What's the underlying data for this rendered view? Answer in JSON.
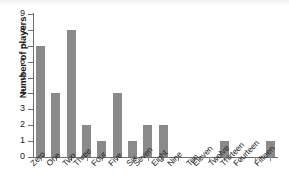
{
  "chart_data": {
    "type": "bar",
    "title": "",
    "xlabel": "",
    "ylabel": "Number of players",
    "categories": [
      "Zero",
      "One",
      "Two",
      "Three",
      "Four",
      "Five",
      "Six",
      "Seven",
      "Eight",
      "Nine",
      "Ten",
      "Eleven",
      "Twelve",
      "Thirteen",
      "Fourteen",
      "Fifteen"
    ],
    "values": [
      7,
      4,
      8,
      2,
      1,
      4,
      1,
      2,
      2,
      0,
      0,
      0,
      1,
      0,
      0,
      1
    ],
    "ylim": [
      0,
      9
    ],
    "yticks": [
      0,
      1,
      2,
      3,
      4,
      5,
      6,
      7,
      8,
      9
    ],
    "ytick_labels": [
      "0",
      "1",
      "2",
      "3",
      "4",
      "5",
      "6",
      "7",
      "8",
      "9"
    ],
    "grid": false,
    "legend": false,
    "bar_color": "#8a8a8a",
    "axis_color": "#6e6e6e",
    "xlabel_rotation": -45
  }
}
